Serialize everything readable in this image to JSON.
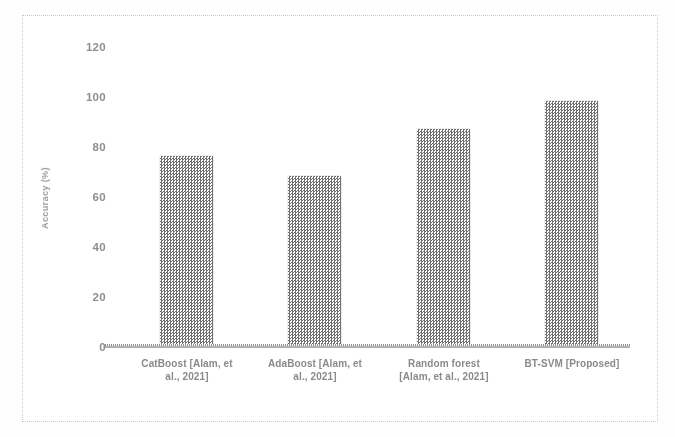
{
  "chart_data": {
    "type": "bar",
    "title": "",
    "xlabel": "",
    "ylabel": "Accuracy (%)",
    "categories": [
      "CatBoost [Alam, et al., 2021]",
      "AdaBoost [Alam, et al., 2021]",
      "Random forest [Alam, et al., 2021]",
      "BT-SVM [Proposed]"
    ],
    "category_lines": [
      [
        "CatBoost [Alam, et",
        "al., 2021]"
      ],
      [
        "AdaBoost [Alam, et",
        "al., 2021]"
      ],
      [
        "Random forest",
        "[Alam, et al., 2021]"
      ],
      [
        "BT-SVM [Proposed]",
        ""
      ]
    ],
    "values": [
      76,
      68,
      87,
      98
    ],
    "ylim": [
      0,
      120
    ],
    "yticks": [
      0,
      20,
      40,
      60,
      80,
      100,
      120
    ],
    "ytick_labels": [
      "0",
      "20",
      "40",
      "60",
      "80",
      "100",
      "120"
    ],
    "grid": false,
    "legend": false,
    "series": [
      {
        "name": "Accuracy (%)",
        "values": [
          76,
          68,
          87,
          98
        ]
      }
    ],
    "colors": {
      "bar_fill": "#9d9d9d",
      "bar_pattern_dark": "#6f6f6f",
      "axis": "#b0b0b0",
      "text": "#8a8a8a",
      "frame": "#c9c9c9",
      "background": "#ffffff"
    }
  }
}
